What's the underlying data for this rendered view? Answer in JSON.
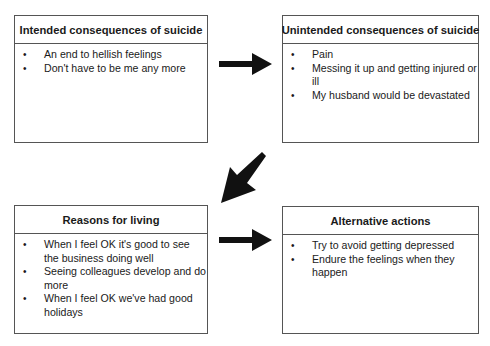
{
  "diagram": {
    "boxes": [
      {
        "title": "Intended consequences of suicide",
        "items": [
          "An end to hellish feelings",
          "Don't have to be me any more"
        ]
      },
      {
        "title": "Unintended consequences of suicide",
        "items": [
          "Pain",
          "Messing it up and getting injured or ill",
          "My husband would be devastated"
        ]
      },
      {
        "title": "Reasons for living",
        "items": [
          "When I feel OK it's good to see the business doing well",
          "Seeing colleagues develop and do more",
          "When I feel OK we've had good holidays"
        ]
      },
      {
        "title": "Alternative actions",
        "items": [
          "Try to avoid getting depressed",
          "Endure the feelings when they happen"
        ]
      }
    ],
    "arrows": [
      {
        "from": "Intended consequences of suicide",
        "to": "Unintended consequences of suicide",
        "direction": "right"
      },
      {
        "from": "Unintended consequences of suicide",
        "to": "Reasons for living",
        "direction": "down-left"
      },
      {
        "from": "Reasons for living",
        "to": "Alternative actions",
        "direction": "right"
      }
    ],
    "colors": {
      "arrow": "#111111",
      "border": "#555555"
    }
  }
}
